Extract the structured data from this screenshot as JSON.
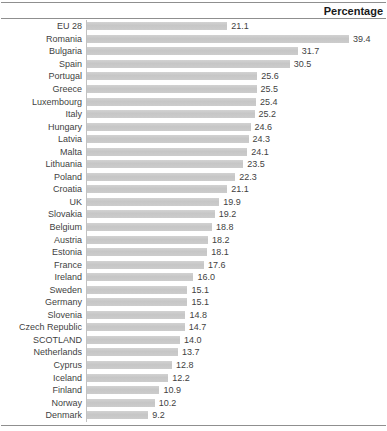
{
  "header": {
    "title": "Percentage"
  },
  "chart_data": {
    "type": "bar",
    "orientation": "horizontal",
    "title": "Percentage",
    "xlabel": "Percentage",
    "ylabel": "",
    "xlim": [
      0,
      39.4
    ],
    "grid": false,
    "legend": false,
    "bar_color": "#c9c9c9",
    "rule_color": "#8f8f8f",
    "categories": [
      "EU 28",
      "Romania",
      "Bulgaria",
      "Spain",
      "Portugal",
      "Greece",
      "Luxembourg",
      "Italy",
      "Hungary",
      "Latvia",
      "Malta",
      "Lithuania",
      "Poland",
      "Croatia",
      "UK",
      "Slovakia",
      "Belgium",
      "Austria",
      "Estonia",
      "France",
      "Ireland",
      "Sweden",
      "Germany",
      "Slovenia",
      "Czech Republic",
      "SCOTLAND",
      "Netherlands",
      "Cyprus",
      "Iceland",
      "Finland",
      "Norway",
      "Denmark"
    ],
    "values": [
      21.1,
      39.4,
      31.7,
      30.5,
      25.6,
      25.5,
      25.4,
      25.2,
      24.6,
      24.3,
      24.1,
      23.5,
      22.3,
      21.1,
      19.9,
      19.2,
      18.8,
      18.2,
      18.1,
      17.6,
      16.0,
      15.1,
      15.1,
      14.8,
      14.7,
      14.0,
      13.7,
      12.8,
      12.2,
      10.9,
      10.2,
      9.2
    ]
  }
}
